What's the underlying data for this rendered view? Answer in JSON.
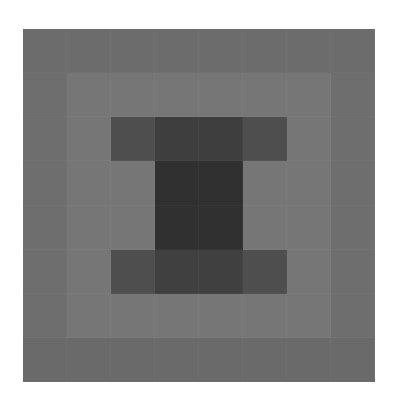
{
  "chart_data": {
    "type": "heatmap",
    "title": "",
    "xlabel": "",
    "ylabel": "",
    "colormap": "grayscale",
    "grid": false,
    "legend": null,
    "rows": 8,
    "cols": 8,
    "values": [
      [
        108,
        108,
        108,
        108,
        108,
        108,
        108,
        108
      ],
      [
        110,
        118,
        118,
        118,
        118,
        118,
        118,
        110
      ],
      [
        110,
        118,
        78,
        62,
        62,
        78,
        118,
        110
      ],
      [
        110,
        118,
        118,
        48,
        48,
        118,
        118,
        110
      ],
      [
        110,
        118,
        118,
        48,
        48,
        118,
        118,
        110
      ],
      [
        110,
        118,
        78,
        64,
        64,
        78,
        118,
        110
      ],
      [
        110,
        118,
        118,
        118,
        118,
        118,
        118,
        110
      ],
      [
        106,
        106,
        106,
        106,
        106,
        106,
        106,
        106
      ]
    ],
    "value_range": [
      0,
      255
    ]
  },
  "figure": {
    "background": "#ffffff"
  }
}
